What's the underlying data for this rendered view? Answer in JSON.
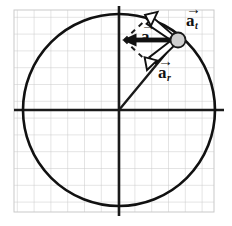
{
  "figure": {
    "kind": "physics-vector-diagram",
    "canvas": {
      "width": 232,
      "height": 226,
      "background": "#ffffff"
    },
    "grid": {
      "name": "graph-paper-background",
      "x": 14,
      "y": 10,
      "width": 200,
      "height": 202,
      "cell": 16.8,
      "line_color": "#c9c9c9",
      "line_width": 1
    },
    "circle": {
      "name": "circular-path",
      "cx": 119,
      "cy": 110,
      "r": 96,
      "stroke": "#111111",
      "stroke_width": 2.6,
      "fill": "none"
    },
    "axes": {
      "stroke": "#1a1a1a",
      "stroke_width": 2.6,
      "horizontal": {
        "x1": 14,
        "y1": 110,
        "x2": 224,
        "y2": 110
      },
      "vertical": {
        "x1": 119,
        "y1": 6,
        "x2": 119,
        "y2": 216
      }
    },
    "radius_line": {
      "name": "radius-to-particle",
      "x1": 119,
      "y1": 110,
      "x2": 172,
      "y2": 46,
      "stroke": "#1a1a1a",
      "stroke_width": 2.4
    },
    "particle": {
      "name": "particle-ball",
      "cx": 178,
      "cy": 40,
      "r": 7.5,
      "fill": "#cfcfcf",
      "stroke": "#1a1a1a",
      "stroke_width": 1.8
    },
    "vectors": [
      {
        "id": "a",
        "name": "total-acceleration-vector",
        "label": "a",
        "subscript": "",
        "style": "solid-filled",
        "color": "#111111",
        "from": {
          "x": 178,
          "y": 40
        },
        "to": {
          "x": 124,
          "y": 40
        },
        "shaft_width": 4.5,
        "head_length": 13,
        "head_width": 11,
        "description": "horizontal solid black arrow pointing left (resultant acceleration)"
      },
      {
        "id": "a_t",
        "name": "tangential-acceleration-vector",
        "label": "a",
        "subscript": "t",
        "style": "hollow-outline",
        "color": "#111111",
        "fill": "#ffffff",
        "from": {
          "x": 178,
          "y": 40
        },
        "to": {
          "x": 150,
          "y": 16
        },
        "shaft_width": 4.5,
        "head_length": 13,
        "head_width": 12,
        "description": "open/white arrow pointing up-left, tangent to the circle"
      },
      {
        "id": "a_r",
        "name": "radial-acceleration-vector",
        "label": "a",
        "subscript": "r",
        "style": "hollow-outline",
        "color": "#111111",
        "fill": "#ffffff",
        "from": {
          "x": 178,
          "y": 40
        },
        "to": {
          "x": 152,
          "y": 66
        },
        "shaft_width": 4.5,
        "head_length": 13,
        "head_width": 12,
        "description": "open/white arrow pointing down-left toward the circle centre"
      }
    ],
    "construction_lines": {
      "name": "parallelogram-dashed-guides",
      "stroke": "#1a1a1a",
      "stroke_width": 2,
      "dash": "5 5",
      "segments": [
        {
          "x1": 124,
          "y1": 40,
          "x2": 150,
          "y2": 16
        },
        {
          "x1": 124,
          "y1": 40,
          "x2": 152,
          "y2": 66
        }
      ]
    },
    "labels": {
      "harpoon": "→",
      "a": {
        "glyph": "a",
        "sub": ""
      },
      "a_t": {
        "glyph": "a",
        "sub": "t"
      },
      "a_r": {
        "glyph": "a",
        "sub": "r"
      }
    }
  }
}
